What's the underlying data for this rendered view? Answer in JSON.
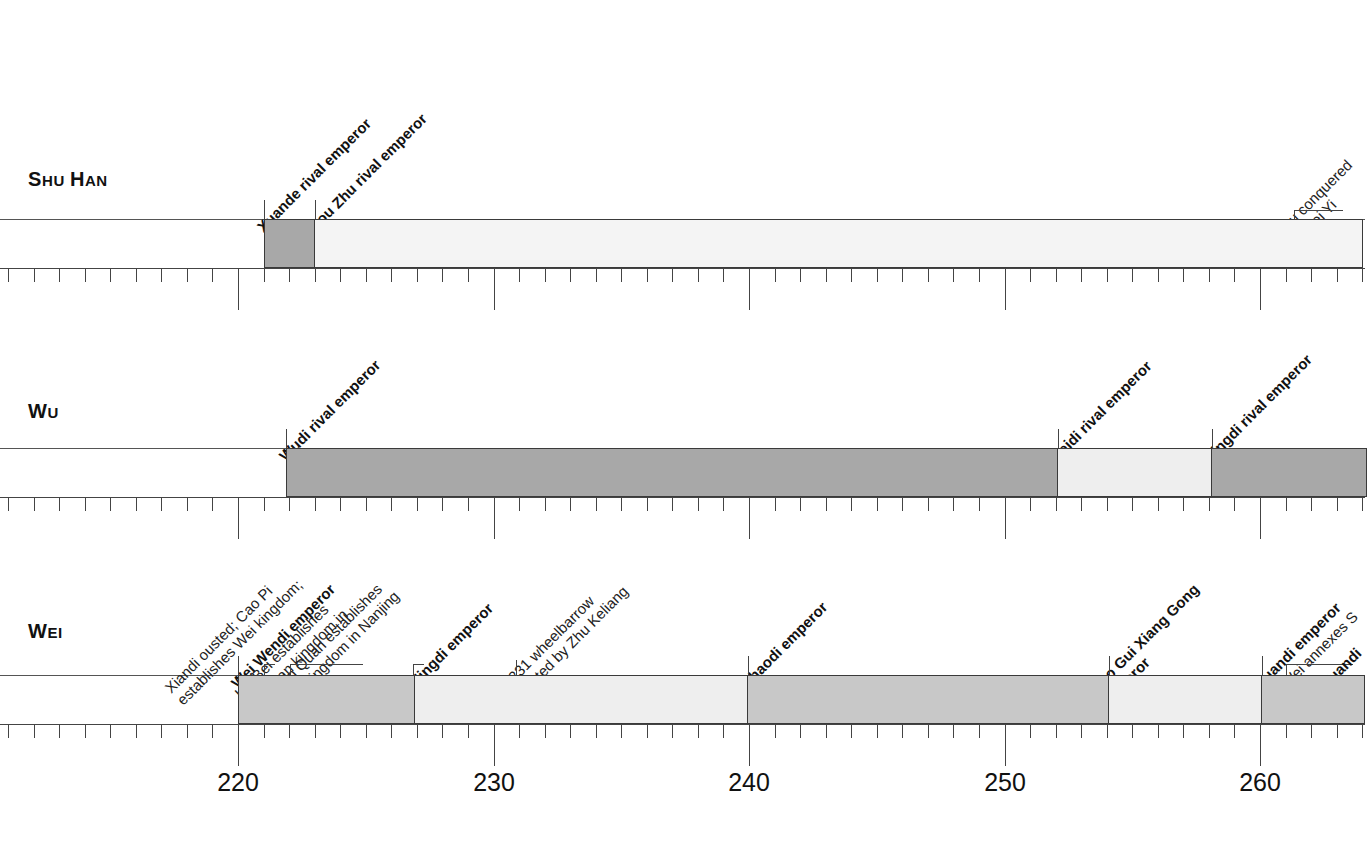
{
  "figure": {
    "axis": {
      "labels": [
        "220",
        "230",
        "240",
        "250",
        "260"
      ],
      "label_years": [
        220,
        230,
        240,
        250,
        260
      ],
      "tick_start_year": 211,
      "tick_end_year": 264,
      "minor_interval_years": 1,
      "major_interval_years": 10,
      "px_per_year": 25.55,
      "year_220_x": 238
    },
    "colors": {
      "dark": "#a8a8a8",
      "mid": "#c8c8c8",
      "light": "#eeeeee",
      "pale": "#f4f4f4",
      "rule": "#3a3a3a",
      "text": "#111111"
    }
  },
  "rows": [
    {
      "name": "shu-han",
      "label_lead": "S",
      "label_rest": "HU ",
      "label_lead2": "H",
      "label_rest2": "AN",
      "label_full": "SHU HAN",
      "segments": [
        {
          "name": "xuande-reign",
          "start": 221,
          "end": 223,
          "shade": "dark"
        },
        {
          "name": "hou-zhu-reign",
          "start": 223,
          "end": 264,
          "shade": "pale"
        }
      ],
      "annotations": [
        {
          "name": "xuande-rival-emperor",
          "text": "Xuande rival emperor",
          "year": 221,
          "bold": true
        },
        {
          "name": "hou-zhu-rival-emperor",
          "text": "Hou Zhu rival emperor",
          "year": 223,
          "bold": true
        },
        {
          "name": "shu-conquered-by-wei",
          "text": "Shu conquered\nby Wei Yi",
          "year": 263,
          "bold": false,
          "clipped": true
        }
      ]
    },
    {
      "name": "wu",
      "label_lead": "W",
      "label_rest": "U",
      "label_full": "WU",
      "segments": [
        {
          "name": "wudi-reign",
          "start": 222,
          "end": 252,
          "shade": "dark"
        },
        {
          "name": "feidi-reign",
          "start": 252,
          "end": 258,
          "shade": "light"
        },
        {
          "name": "jingdi-reign",
          "start": 258,
          "end": 264,
          "shade": "dark"
        }
      ],
      "annotations": [
        {
          "name": "wudi-rival-emperor",
          "text": "Wudi rival emperor",
          "year": 222,
          "bold": true
        },
        {
          "name": "feidi-rival-emperor",
          "text": "Feidi rival emperor",
          "year": 252,
          "bold": true
        },
        {
          "name": "jingdi-rival-emperor",
          "text": "Jingdi rival emperor",
          "year": 258,
          "bold": true
        }
      ]
    },
    {
      "name": "wei",
      "label_lead": "W",
      "label_rest": "EI",
      "label_full": "WEI",
      "segments": [
        {
          "name": "wei-wendi-reign",
          "start": 220,
          "end": 227,
          "shade": "mid"
        },
        {
          "name": "mingdi-reign",
          "start": 227,
          "end": 240,
          "shade": "light"
        },
        {
          "name": "shaodi-reign",
          "start": 240,
          "end": 254,
          "shade": "mid"
        },
        {
          "name": "gao-gui-xiang-reign",
          "start": 254,
          "end": 260,
          "shade": "light"
        },
        {
          "name": "yuandi-reign",
          "start": 260,
          "end": 264,
          "shade": "mid"
        }
      ],
      "annotations": [
        {
          "name": "xiandi-ousted-cao-pi",
          "text": "Xiandi ousted; Cao Pi\nestablishes Wei kingdom;",
          "year": 220,
          "bold": false
        },
        {
          "name": "wei-wendi-emperor",
          "text": "Wei Wendi emperor",
          "year": 220,
          "bold": true
        },
        {
          "name": "liu-bei-establishes-shu-han",
          "text": "Liu Bei establishes\nShu Han kingdom in\nSichuan",
          "year": 221,
          "bold": false
        },
        {
          "name": "sun-quan-establishes-wu",
          "text": "Sun Quan establishes\nWu kingdom in Nanjing",
          "year": 222,
          "bold": false
        },
        {
          "name": "mingdi-emperor",
          "text": "Mingdi emperor",
          "year": 227,
          "bold": true
        },
        {
          "name": "wheelbarrow-invented",
          "text": "c. 231 wheelbarrow\ninvented by Zhu Keliang",
          "year": 231,
          "bold": false
        },
        {
          "name": "shaodi-emperor",
          "text": "Shaodi emperor",
          "year": 240,
          "bold": true
        },
        {
          "name": "gao-gui-xiang-gong-emperor",
          "text": "Gao Gui Xiang Gong\nemperor",
          "year": 254,
          "bold": true
        },
        {
          "name": "yuandi-emperor",
          "text": "Yuandi emperor",
          "year": 260,
          "bold": true
        },
        {
          "name": "wei-annexes-shu",
          "text": "Wei annexes S",
          "year": 262,
          "bold": false,
          "clipped": true
        },
        {
          "name": "yuandi-clipped",
          "text": "Yuandi",
          "year": 263,
          "bold": true,
          "clipped": true
        }
      ]
    }
  ]
}
